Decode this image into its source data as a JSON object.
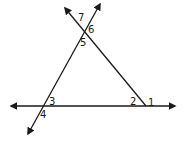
{
  "diagram": {
    "type": "geometry-angles",
    "line_color": "#1a1a1a",
    "angle_labels": [
      {
        "id": "1",
        "text": "1",
        "x": 148,
        "y": 98
      },
      {
        "id": "2",
        "text": "2",
        "x": 130,
        "y": 98
      },
      {
        "id": "3",
        "text": "3",
        "x": 48,
        "y": 97
      },
      {
        "id": "4",
        "text": "4",
        "x": 40,
        "y": 110
      },
      {
        "id": "5",
        "text": "5",
        "x": 80,
        "y": 38
      },
      {
        "id": "6",
        "text": "6",
        "x": 89,
        "y": 25
      },
      {
        "id": "7",
        "text": "7",
        "x": 78,
        "y": 13
      }
    ]
  }
}
